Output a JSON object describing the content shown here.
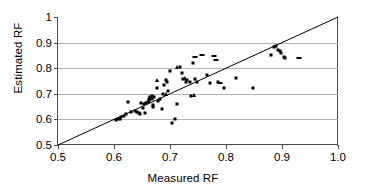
{
  "chart_data": {
    "type": "scatter",
    "title": "",
    "xlabel": "Measured RF",
    "ylabel": "Estimated RF",
    "xlim": [
      0.5,
      1.0
    ],
    "ylim": [
      0.5,
      1.0
    ],
    "xticks": [
      "0.5",
      "0.6",
      "0.7",
      "0.8",
      "0.9",
      "1.0"
    ],
    "xtick_values": [
      0.5,
      0.6,
      0.7,
      0.8,
      0.9,
      1.0
    ],
    "yticks": [
      "0.5",
      "0.6",
      "0.7",
      "0.8",
      "0.9",
      "1"
    ],
    "ytick_values": [
      0.5,
      0.6,
      0.7,
      0.8,
      0.9,
      1.0
    ],
    "grid": "horizontal",
    "gridline_values": [
      0.6,
      0.7,
      0.8,
      0.9
    ],
    "gridline_color": "#b3b3b3",
    "axis_color": "#4d4d4d",
    "marker_color": "#000000",
    "legend": "none",
    "reference_line": {
      "label": "1:1 line",
      "from": [
        0.5,
        0.5
      ],
      "to": [
        1.0,
        1.0
      ],
      "color": "#000000"
    },
    "series": [
      {
        "name": "Estimated vs Measured RF",
        "marker": "square",
        "points": [
          [
            0.604,
            0.596
          ],
          [
            0.607,
            0.6
          ],
          [
            0.611,
            0.601
          ],
          [
            0.612,
            0.608
          ],
          [
            0.617,
            0.612
          ],
          [
            0.622,
            0.621
          ],
          [
            0.625,
            0.668
          ],
          [
            0.631,
            0.627
          ],
          [
            0.637,
            0.632
          ],
          [
            0.641,
            0.63
          ],
          [
            0.645,
            0.624
          ],
          [
            0.647,
            0.622
          ],
          [
            0.648,
            0.666
          ],
          [
            0.652,
            0.646
          ],
          [
            0.654,
            0.661
          ],
          [
            0.655,
            0.626
          ],
          [
            0.657,
            0.664
          ],
          [
            0.66,
            0.668
          ],
          [
            0.662,
            0.672
          ],
          [
            0.663,
            0.68
          ],
          [
            0.664,
            0.685
          ],
          [
            0.665,
            0.688
          ],
          [
            0.666,
            0.684
          ],
          [
            0.667,
            0.678
          ],
          [
            0.668,
            0.69
          ],
          [
            0.669,
            0.658
          ],
          [
            0.67,
            0.648
          ],
          [
            0.672,
            0.686
          ],
          [
            0.676,
            0.724
          ],
          [
            0.679,
            0.67
          ],
          [
            0.683,
            0.678
          ],
          [
            0.686,
            0.641
          ],
          [
            0.688,
            0.7
          ],
          [
            0.69,
            0.733
          ],
          [
            0.692,
            0.752
          ],
          [
            0.694,
            0.747
          ],
          [
            0.697,
            0.712
          ],
          [
            0.7,
            0.79
          ],
          [
            0.704,
            0.586
          ],
          [
            0.709,
            0.601
          ],
          [
            0.712,
            0.661
          ],
          [
            0.718,
            0.803
          ],
          [
            0.721,
            0.783
          ],
          [
            0.723,
            0.757
          ],
          [
            0.728,
            0.746
          ],
          [
            0.731,
            0.752
          ],
          [
            0.735,
            0.745
          ],
          [
            0.738,
            0.69
          ],
          [
            0.741,
            0.822
          ],
          [
            0.744,
            0.756
          ],
          [
            0.748,
            0.747
          ],
          [
            0.766,
            0.772
          ],
          [
            0.771,
            0.742
          ],
          [
            0.786,
            0.748
          ],
          [
            0.796,
            0.722
          ],
          [
            0.817,
            0.762
          ],
          [
            0.849,
            0.722
          ],
          [
            0.88,
            0.852
          ],
          [
            0.885,
            0.884
          ],
          [
            0.889,
            0.888
          ],
          [
            0.893,
            0.87
          ],
          [
            0.896,
            0.866
          ],
          [
            0.899,
            0.858
          ],
          [
            0.903,
            0.842
          ],
          [
            0.906,
            0.841
          ]
        ]
      },
      {
        "name": "dash markers",
        "marker": "dash",
        "points": [
          [
            0.757,
            0.853
          ],
          [
            0.778,
            0.849
          ],
          [
            0.783,
            0.832
          ],
          [
            0.79,
            0.743
          ],
          [
            0.744,
            0.843
          ],
          [
            0.93,
            0.841
          ]
        ]
      },
      {
        "name": "triangle markers",
        "marker": "triangle",
        "points": [
          [
            0.676,
            0.752
          ],
          [
            0.692,
            0.698
          ],
          [
            0.713,
            0.806
          ],
          [
            0.726,
            0.76
          ],
          [
            0.742,
            0.695
          ]
        ]
      }
    ]
  }
}
